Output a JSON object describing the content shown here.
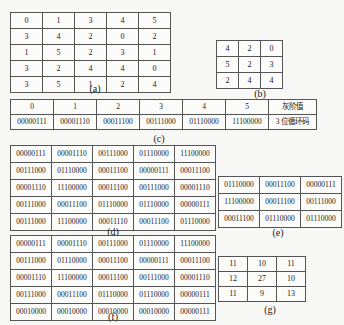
{
  "figures": {
    "a": {
      "caption": "(a)",
      "rows": [
        [
          "0",
          "1",
          "3",
          "4",
          "5"
        ],
        [
          "3",
          "4",
          "2",
          "0",
          "2"
        ],
        [
          "1",
          "5",
          "2",
          "3",
          "1"
        ],
        [
          "3",
          "2",
          "4",
          "4",
          "0"
        ],
        [
          "3",
          "5",
          "1",
          "2",
          "4"
        ]
      ]
    },
    "b": {
      "caption": "(b)",
      "rows": [
        [
          "4",
          "2",
          "0"
        ],
        [
          "5",
          "2",
          "3"
        ],
        [
          "2",
          "4",
          "4"
        ]
      ]
    },
    "c": {
      "caption": "(c)",
      "header": [
        "0",
        "1",
        "2",
        "3",
        "4",
        "5",
        "灰阶值"
      ],
      "codes": [
        "00000111",
        "00001110",
        "00011100",
        "00111000",
        "01110000",
        "11100000",
        "3 位循环码"
      ]
    },
    "d": {
      "caption": "(d)",
      "rows": [
        [
          "00000111",
          "00001110",
          "00111000",
          "01110000",
          "11100000"
        ],
        [
          "00111000",
          "01110000",
          "00011100",
          "00000111",
          "00011100"
        ],
        [
          "00001110",
          "11100000",
          "00011100",
          "00111000",
          "00001110"
        ],
        [
          "00111000",
          "00011100",
          "01110000",
          "01110000",
          "00000111"
        ],
        [
          "00111000",
          "11100000",
          "00011110",
          "00011100",
          "01110000"
        ]
      ]
    },
    "e": {
      "caption": "(e)",
      "rows": [
        [
          "01110000",
          "00011100",
          "00000111"
        ],
        [
          "11100000",
          "00011100",
          "00111000"
        ],
        [
          "00011100",
          "01110000",
          "01110000"
        ]
      ]
    },
    "f": {
      "caption": "(f)",
      "rows": [
        [
          "00000111",
          "00001110",
          "00111000",
          "01110000",
          "11100000"
        ],
        [
          "00111000",
          "01110000",
          "00011100",
          "00000111",
          "00011100"
        ],
        [
          "00001110",
          "11100000",
          "00011100",
          "00111000",
          "00001110"
        ],
        [
          "00111000",
          "00011100",
          "01110000",
          "01110000",
          "00000111"
        ],
        [
          "00010000",
          "00010000",
          "00010000",
          "00010000",
          "00000111"
        ]
      ]
    },
    "g": {
      "caption": "(g)",
      "rows": [
        [
          "11",
          "10",
          "11"
        ],
        [
          "12",
          "27",
          "10"
        ],
        [
          "11",
          "9",
          "13"
        ]
      ]
    }
  }
}
